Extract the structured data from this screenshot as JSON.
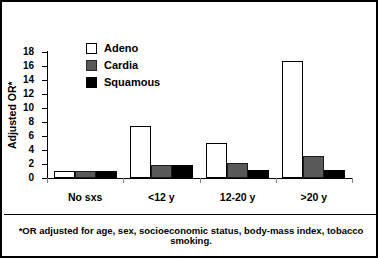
{
  "chart_data": {
    "type": "bar",
    "title": "",
    "xlabel": "",
    "ylabel": "Adjusted OR*",
    "ylim": [
      0,
      18
    ],
    "yticks": [
      0,
      2,
      4,
      6,
      8,
      10,
      12,
      14,
      16,
      18
    ],
    "grid": false,
    "legend_position": "top-left-inside",
    "categories": [
      "No sxs",
      "<12 y",
      "12-20 y",
      ">20 y"
    ],
    "series": [
      {
        "name": "Adeno",
        "color": "#ffffff",
        "values": [
          1.0,
          7.5,
          5.0,
          16.7
        ]
      },
      {
        "name": "Cardia",
        "color": "#595959",
        "values": [
          1.0,
          1.8,
          2.2,
          3.2
        ]
      },
      {
        "name": "Squamous",
        "color": "#000000",
        "values": [
          1.0,
          1.8,
          1.2,
          1.2
        ]
      }
    ],
    "annotations": [
      "*OR adjusted for age, sex, socioeconomic status, body-mass index, tobacco smoking."
    ]
  },
  "axis": {
    "y_title": "Adjusted OR*",
    "tick_18": "18",
    "tick_16": "16",
    "tick_14": "14",
    "tick_12": "12",
    "tick_10": "10",
    "tick_8": "8",
    "tick_6": "6",
    "tick_4": "4",
    "tick_2": "2",
    "tick_0": "0"
  },
  "legend": {
    "items": [
      {
        "label": "Adeno"
      },
      {
        "label": "Cardia"
      },
      {
        "label": "Squamous"
      }
    ]
  },
  "categories": [
    {
      "label": "No sxs"
    },
    {
      "label": "<12 y"
    },
    {
      "label": "12-20 y"
    },
    {
      "label": ">20 y"
    }
  ],
  "footnote": {
    "text": "*OR adjusted for age, sex, socioeconomic status, body-mass index, tobacco smoking."
  }
}
